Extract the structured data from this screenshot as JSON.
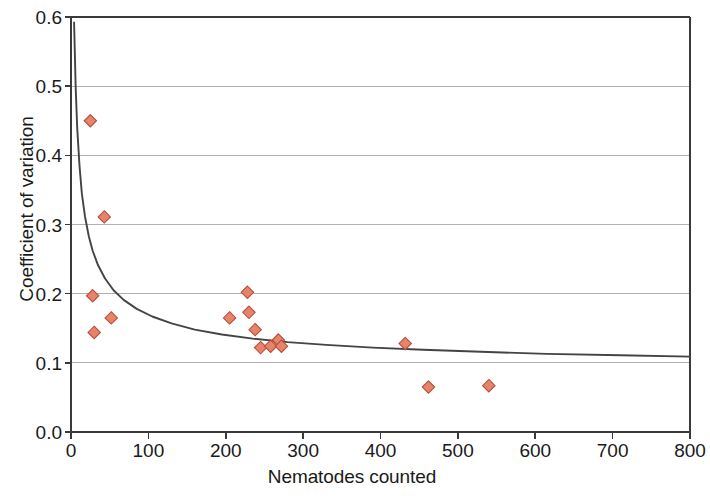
{
  "chart_data": {
    "type": "scatter",
    "title": "",
    "xlabel": "Nematodes counted",
    "ylabel": "Coefficient of variation",
    "xlim": [
      0,
      800
    ],
    "ylim": [
      0.0,
      0.6
    ],
    "xticks": [
      "0",
      "100",
      "200",
      "300",
      "400",
      "500",
      "600",
      "700",
      "800"
    ],
    "xtick_values": [
      0,
      100,
      200,
      300,
      400,
      500,
      600,
      700,
      800
    ],
    "yticks": [
      "0.0",
      "0.1",
      "0.2",
      "0.3",
      "0.4",
      "0.5",
      "0.6"
    ],
    "ytick_values": [
      0.0,
      0.1,
      0.2,
      0.3,
      0.4,
      0.5,
      0.6
    ],
    "grid": "horizontal",
    "legend": "none",
    "marker": "diamond",
    "marker_color": "#E8836B",
    "marker_edge_color": "#B4503A",
    "curve_color": "#444444",
    "grid_color": "#B0B0B0",
    "axis_color": "#3a3a3a",
    "series": [
      {
        "name": "observations",
        "type": "scatter",
        "points": [
          {
            "x": 25,
            "y": 0.45
          },
          {
            "x": 28,
            "y": 0.197
          },
          {
            "x": 30,
            "y": 0.144
          },
          {
            "x": 43,
            "y": 0.311
          },
          {
            "x": 52,
            "y": 0.165
          },
          {
            "x": 205,
            "y": 0.165
          },
          {
            "x": 228,
            "y": 0.202
          },
          {
            "x": 230,
            "y": 0.173
          },
          {
            "x": 238,
            "y": 0.148
          },
          {
            "x": 245,
            "y": 0.122
          },
          {
            "x": 258,
            "y": 0.124
          },
          {
            "x": 268,
            "y": 0.133
          },
          {
            "x": 272,
            "y": 0.124
          },
          {
            "x": 432,
            "y": 0.128
          },
          {
            "x": 462,
            "y": 0.065
          },
          {
            "x": 540,
            "y": 0.067
          }
        ]
      },
      {
        "name": "fitted-curve",
        "type": "line",
        "description": "decaying fitted curve approaching an asymptote near 0.11",
        "points": [
          {
            "x": 4,
            "y": 0.592
          },
          {
            "x": 6,
            "y": 0.5
          },
          {
            "x": 8,
            "y": 0.44
          },
          {
            "x": 11,
            "y": 0.385
          },
          {
            "x": 14,
            "y": 0.345
          },
          {
            "x": 18,
            "y": 0.312
          },
          {
            "x": 23,
            "y": 0.283
          },
          {
            "x": 28,
            "y": 0.262
          },
          {
            "x": 35,
            "y": 0.241
          },
          {
            "x": 44,
            "y": 0.222
          },
          {
            "x": 55,
            "y": 0.205
          },
          {
            "x": 68,
            "y": 0.191
          },
          {
            "x": 85,
            "y": 0.178
          },
          {
            "x": 105,
            "y": 0.167
          },
          {
            "x": 130,
            "y": 0.157
          },
          {
            "x": 160,
            "y": 0.148
          },
          {
            "x": 195,
            "y": 0.141
          },
          {
            "x": 235,
            "y": 0.135
          },
          {
            "x": 280,
            "y": 0.13
          },
          {
            "x": 330,
            "y": 0.126
          },
          {
            "x": 390,
            "y": 0.122
          },
          {
            "x": 455,
            "y": 0.119
          },
          {
            "x": 530,
            "y": 0.116
          },
          {
            "x": 615,
            "y": 0.113
          },
          {
            "x": 710,
            "y": 0.111
          },
          {
            "x": 800,
            "y": 0.109
          }
        ]
      }
    ]
  }
}
